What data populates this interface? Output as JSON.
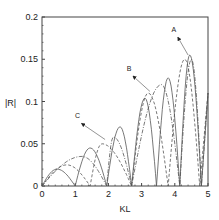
{
  "chart_data": {
    "type": "line",
    "title": "",
    "xlabel": "KL",
    "ylabel": "|R|",
    "xlim": [
      0,
      5
    ],
    "ylim": [
      0,
      0.2
    ],
    "x_ticks": [
      "0",
      "1",
      "2",
      "3",
      "4",
      "5"
    ],
    "y_ticks": [
      "0",
      "0.05",
      "0.1",
      "0.15",
      "0.2"
    ],
    "grid": false,
    "legend": "none (curves labeled by arrows A, B, C)",
    "annotations": [
      {
        "label": "A",
        "text_x": 4.0,
        "text_y": 0.182,
        "arrow_to_x": 4.4,
        "arrow_to_y": 0.155
      },
      {
        "label": "B",
        "text_x": 2.65,
        "text_y": 0.136,
        "arrow_to_x": 3.25,
        "arrow_to_y": 0.112
      },
      {
        "label": "C",
        "text_x": 1.1,
        "text_y": 0.08,
        "arrow_to_x": 1.9,
        "arrow_to_y": 0.055
      }
    ],
    "series": [
      {
        "name": "A",
        "style": "solid",
        "peaks": [
          [
            0.45,
            0.02
          ],
          [
            1.45,
            0.045
          ],
          [
            2.35,
            0.07
          ],
          [
            3.1,
            0.104
          ],
          [
            3.8,
            0.128
          ],
          [
            4.45,
            0.155
          ]
        ],
        "zeros": [
          0,
          1.0,
          1.95,
          2.7,
          3.45,
          4.15,
          4.8
        ]
      },
      {
        "name": "B",
        "style": "dashed",
        "peaks": [
          [
            0.75,
            0.025
          ],
          [
            1.8,
            0.05
          ],
          [
            3.2,
            0.11
          ],
          [
            4.3,
            0.15
          ]
        ],
        "zeros": [
          0,
          1.45,
          2.7,
          3.8,
          4.75
        ]
      },
      {
        "name": "C",
        "style": "dash-dot",
        "peaks": [
          [
            1.2,
            0.035
          ],
          [
            2.15,
            0.058
          ],
          [
            3.6,
            0.12
          ],
          [
            4.5,
            0.15
          ]
        ],
        "zeros": [
          0,
          1.95,
          2.7,
          4.15,
          4.8
        ]
      }
    ]
  }
}
